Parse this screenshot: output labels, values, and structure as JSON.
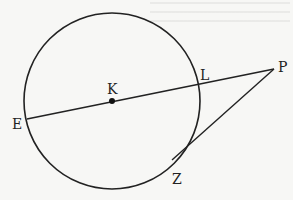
{
  "diagram": {
    "type": "geometry",
    "circle": {
      "center_label": "K",
      "cx": 112,
      "cy": 101,
      "r": 88
    },
    "points": [
      {
        "id": "E",
        "label": "E",
        "x": 27,
        "y": 119
      },
      {
        "id": "K",
        "label": "K",
        "x": 112,
        "y": 101
      },
      {
        "id": "L",
        "label": "L",
        "x": 196,
        "y": 85
      },
      {
        "id": "P",
        "label": "P",
        "x": 274,
        "y": 69
      },
      {
        "id": "Z",
        "label": "Z",
        "x": 172,
        "y": 160
      }
    ],
    "segments": [
      {
        "from": "E",
        "to": "P",
        "kind": "secant"
      },
      {
        "from": "P",
        "to": "Z",
        "kind": "tangent"
      }
    ],
    "stroke_color": "#222222"
  }
}
